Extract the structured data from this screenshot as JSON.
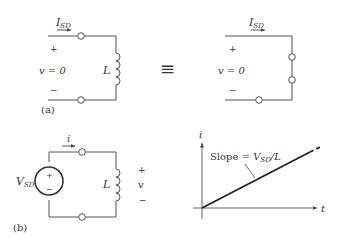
{
  "figure_a": {
    "label": "(a)",
    "left_circuit": {
      "current_label": "I",
      "current_sub": "SD",
      "plus": "+",
      "minus": "−",
      "voltage_label": "v = 0",
      "inductor_label": "L"
    },
    "equivalence_symbol": "≡",
    "right_circuit": {
      "current_label": "I",
      "current_sub": "SD",
      "plus": "+",
      "minus": "−",
      "voltage_label": "v = 0"
    }
  },
  "figure_b": {
    "label": "(b)",
    "circuit": {
      "source_label": "V",
      "source_sub": "SD",
      "source_plus": "+",
      "source_minus": "−",
      "current_label": "i",
      "inductor_label": "L",
      "plus": "+",
      "voltage_label": "v",
      "minus": "−"
    },
    "graph": {
      "y_axis_label": "i",
      "x_axis_label": "t",
      "slope_prefix": "Slope = ",
      "slope_v": "V",
      "slope_sub": "SD",
      "slope_suffix": "/L"
    }
  },
  "colors": {
    "wire": "#555555",
    "text": "#333333",
    "plot_line": "#222222"
  }
}
